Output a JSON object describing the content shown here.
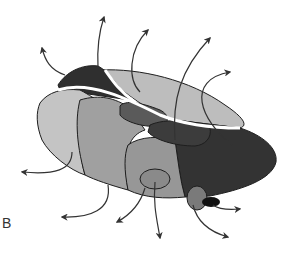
{
  "figure": {
    "panel_label": "B",
    "colors": {
      "background": "#ffffff",
      "outline": "#1e1e1e",
      "region_lightest": "#c4c4c4",
      "region_light": "#b2b2b2",
      "region_mid": "#9a9a9a",
      "region_mid_dark": "#8a8a8a",
      "region_dark": "#4a4a4a",
      "region_darkest": "#2f2f2f",
      "top_light": "#bdbdbd",
      "stripe": "#ffffff",
      "arrow": "#333333"
    },
    "arrows_count": 13
  }
}
